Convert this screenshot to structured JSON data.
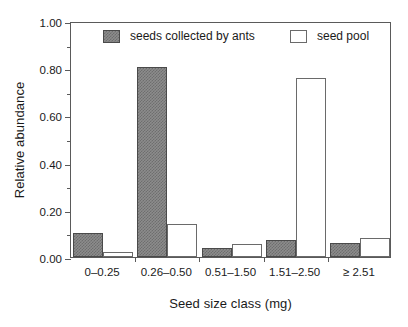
{
  "chart_data": {
    "type": "bar",
    "title": "",
    "xlabel": "Seed size class (mg)",
    "ylabel": "Relative abundance",
    "categories": [
      "0–0.25",
      "0.26–0.50",
      "0.51–1.50",
      "1.51–2.50",
      "≥ 2.51"
    ],
    "series": [
      {
        "name": "seeds collected by ants",
        "color": "#8c8c8c",
        "values": [
          0.1,
          0.805,
          0.04,
          0.072,
          0.06
        ]
      },
      {
        "name": "seed pool",
        "color": "#ffffff",
        "values": [
          0.02,
          0.14,
          0.055,
          0.76,
          0.08
        ]
      }
    ],
    "ylim": [
      0.0,
      1.0
    ],
    "yticks": [
      0.0,
      0.2,
      0.4,
      0.6,
      0.8,
      1.0
    ],
    "ytick_labels": [
      "0.00",
      "0.20",
      "0.40",
      "0.60",
      "0.80",
      "1.00"
    ],
    "yminor_ticks": [
      0.1,
      0.3,
      0.5,
      0.7,
      0.9
    ],
    "grid": false,
    "legend_position": "top-inside"
  },
  "legend": {
    "entries": [
      {
        "label": "seeds collected by ants",
        "swatch": "filled-gray-hatched"
      },
      {
        "label": "seed pool",
        "swatch": "open-white"
      }
    ]
  },
  "axes": {
    "frame_color": "#5a5a5a",
    "text_color": "#1a1a1a"
  }
}
